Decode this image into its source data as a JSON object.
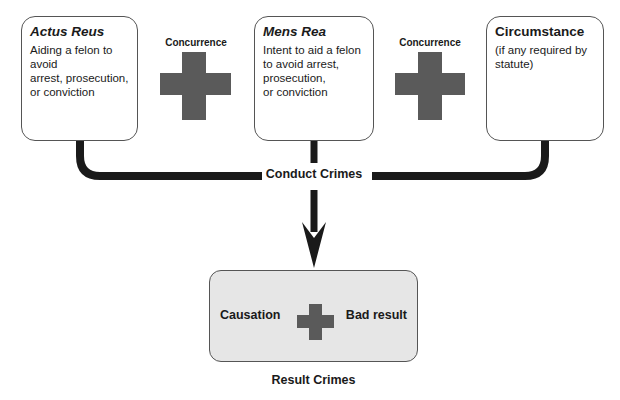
{
  "diagram": {
    "heading_cropped": "",
    "elements": [
      {
        "id": "actus-reus",
        "title": "Actus Reus",
        "title_style": "bold-italic",
        "description": "Aiding a felon to avoid\narrest, prosecution,\nor conviction"
      },
      {
        "id": "mens-rea",
        "title": "Mens Rea",
        "title_style": "bold-italic",
        "description": "Intent to aid a felon\nto avoid arrest,\nprosecution,\nor conviction"
      },
      {
        "id": "circumstance",
        "title": "Circumstance",
        "title_style": "bold",
        "description": "(if any required by\nstatute)"
      }
    ],
    "connectors": [
      {
        "label": "Concurrence",
        "symbol": "plus-icon"
      },
      {
        "label": "Concurrence",
        "symbol": "plus-icon"
      }
    ],
    "conduct_crimes_label": "Conduct Crimes",
    "result": {
      "left_label": "Causation",
      "right_label": "Bad result",
      "symbol": "plus-icon",
      "caption": "Result Crimes"
    },
    "colors": {
      "line": "#1a1a1a",
      "cross": "#5a5a5a",
      "result_fill": "#e6e6e6",
      "box_border": "#555555"
    }
  }
}
